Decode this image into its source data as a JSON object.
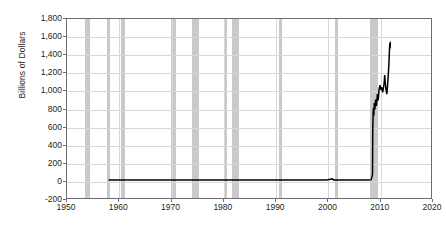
{
  "chart_data": {
    "type": "line",
    "title": "",
    "xlabel": "",
    "ylabel": "Billions of Dollars",
    "xlim": [
      1950,
      2020
    ],
    "ylim": [
      -200,
      1800
    ],
    "ytick_labels": [
      "1,800",
      "1,600",
      "1,400",
      "1,200",
      "1,000",
      "800",
      "600",
      "400",
      "200",
      "0",
      "-200"
    ],
    "ytick_values": [
      1800,
      1600,
      1400,
      1200,
      1000,
      800,
      600,
      400,
      200,
      0,
      -200
    ],
    "xtick_labels": [
      "1950",
      "1960",
      "1970",
      "1980",
      "1990",
      "2000",
      "2010",
      "2020"
    ],
    "xtick_values": [
      1950,
      1960,
      1970,
      1980,
      1990,
      2000,
      2010,
      2020
    ],
    "grid": true,
    "legend": "none",
    "series": [
      {
        "name": "Excess Reserves of Depository Institutions",
        "color": "#000000",
        "points": [
          [
            1958.0,
            0
          ],
          [
            1960.0,
            0
          ],
          [
            1965.0,
            0
          ],
          [
            1970.0,
            1
          ],
          [
            1975.0,
            1
          ],
          [
            1980.0,
            1
          ],
          [
            1985.0,
            1
          ],
          [
            1990.0,
            1
          ],
          [
            1995.0,
            1
          ],
          [
            2000.0,
            1
          ],
          [
            2001.0,
            14
          ],
          [
            2001.3,
            2
          ],
          [
            2003.0,
            1
          ],
          [
            2005.0,
            1
          ],
          [
            2007.0,
            2
          ],
          [
            2008.0,
            2
          ],
          [
            2008.5,
            5
          ],
          [
            2008.75,
            60
          ],
          [
            2008.8,
            560
          ],
          [
            2008.9,
            800
          ],
          [
            2009.0,
            720
          ],
          [
            2009.1,
            860
          ],
          [
            2009.2,
            790
          ],
          [
            2009.35,
            900
          ],
          [
            2009.5,
            830
          ],
          [
            2009.7,
            960
          ],
          [
            2009.85,
            890
          ],
          [
            2010.0,
            1010
          ],
          [
            2010.2,
            1060
          ],
          [
            2010.35,
            1010
          ],
          [
            2010.5,
            1040
          ],
          [
            2010.7,
            980
          ],
          [
            2010.85,
            1030
          ],
          [
            2011.0,
            1090
          ],
          [
            2011.1,
            1175
          ],
          [
            2011.2,
            1090
          ],
          [
            2011.35,
            1010
          ],
          [
            2011.5,
            960
          ],
          [
            2011.6,
            1020
          ],
          [
            2011.75,
            1140
          ],
          [
            2011.9,
            1290
          ],
          [
            2012.0,
            1440
          ],
          [
            2012.08,
            1530
          ],
          [
            2012.13,
            1470
          ],
          [
            2012.18,
            1545
          ]
        ]
      }
    ],
    "recession_bands": [
      {
        "start": 1953.5,
        "end": 1954.4
      },
      {
        "start": 1957.6,
        "end": 1958.3
      },
      {
        "start": 1960.3,
        "end": 1961.1
      },
      {
        "start": 1969.9,
        "end": 1970.9
      },
      {
        "start": 1973.9,
        "end": 1975.2
      },
      {
        "start": 1980.1,
        "end": 1980.5
      },
      {
        "start": 1981.5,
        "end": 1982.9
      },
      {
        "start": 1990.5,
        "end": 1991.2
      },
      {
        "start": 2001.2,
        "end": 2001.8
      },
      {
        "start": 2007.9,
        "end": 2009.5
      }
    ],
    "colors": {
      "series_line": "#000000",
      "recession_band": "#c9c9c9",
      "gridline": "#d7d7d7",
      "axis": "#6d6e71",
      "text": "#231f20",
      "background": "#ffffff"
    }
  }
}
